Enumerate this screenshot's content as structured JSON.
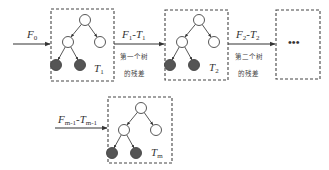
{
  "diagram": {
    "input": {
      "label": "F",
      "sub": "0"
    },
    "trees": [
      {
        "name": "T",
        "sub": "1"
      },
      {
        "name": "T",
        "sub": "2"
      },
      {
        "name": "T",
        "sub": "m"
      }
    ],
    "residuals": [
      {
        "a": "F",
        "a_sub": "1",
        "sep": "-",
        "b": "T",
        "b_sub": "1",
        "note_line1": "第一个树",
        "note_line2": "的残差"
      },
      {
        "a": "F",
        "a_sub": "2",
        "sep": "-",
        "b": "T",
        "b_sub": "2",
        "note_line1": "第二个树",
        "note_line2": "的残差"
      },
      {
        "a": "F",
        "a_sub": "m-1",
        "sep": "-",
        "b": "T",
        "b_sub": "m-1"
      }
    ],
    "ellipsis": "•••",
    "colors": {
      "line": "#333333",
      "leaf_fill": "#555555",
      "node_fill": "#ffffff"
    }
  }
}
